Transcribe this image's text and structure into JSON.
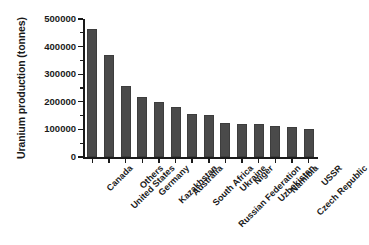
{
  "chart_data": {
    "type": "bar",
    "title": "",
    "xlabel": "",
    "ylabel": "Uranium production (tonnes)",
    "ylim": [
      0,
      500000
    ],
    "ytick_values": [
      0,
      100000,
      200000,
      300000,
      400000,
      500000
    ],
    "ytick_labels": [
      "0",
      "100000",
      "200000",
      "300000",
      "400000",
      "500000"
    ],
    "grid": false,
    "legend": null,
    "bar_color": "#4a4a4a",
    "axis_color": "#1a1a1a",
    "background_color": "#ffffff",
    "xtick_rotation": -45,
    "categories": [
      "Canada",
      "United States",
      "Others",
      "Germany",
      "Kazakhstan",
      "Australia",
      "South Africa",
      "Russian Federation",
      "Ukraine",
      "Niger",
      "Uzbekistan",
      "Namibia",
      "Czech Republic",
      "USSR"
    ],
    "values": [
      465000,
      370000,
      257000,
      219000,
      198000,
      181000,
      157000,
      151000,
      125000,
      121000,
      120000,
      111000,
      108000,
      100000
    ]
  }
}
